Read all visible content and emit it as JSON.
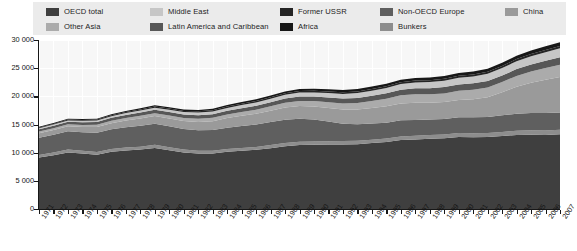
{
  "legend": {
    "rows": [
      [
        {
          "label": "OECD total",
          "color": "#3f3f3f",
          "x": 13
        },
        {
          "label": "Middle East",
          "color": "#c6c6c6",
          "x": 117
        },
        {
          "label": "Former USSR",
          "color": "#252525",
          "x": 247
        },
        {
          "label": "Non-OECD Europe",
          "color": "#5f5f5f",
          "x": 347
        },
        {
          "label": "China",
          "color": "#9a9a9a",
          "x": 472
        }
      ],
      [
        {
          "label": "Other Asia",
          "color": "#ababab",
          "x": 13
        },
        {
          "label": "Latin America and Caribbean",
          "color": "#575757",
          "x": 117
        },
        {
          "label": "Africa",
          "color": "#171717",
          "x": 247
        },
        {
          "label": "Bunkers",
          "color": "#8d8d8d",
          "x": 347
        }
      ]
    ]
  },
  "axes": {
    "y_ticks": [
      "0",
      "5 000",
      "10 000",
      "15 000",
      "20 000",
      "25 000",
      "30 000"
    ],
    "x_ticks": [
      "1971",
      "1972",
      "1973",
      "1974",
      "1975",
      "1976",
      "1977",
      "1978",
      "1979",
      "1980",
      "1981",
      "1982",
      "1983",
      "1984",
      "1985",
      "1986",
      "1987",
      "1988",
      "1989",
      "1990",
      "1991",
      "1992",
      "1993",
      "1994",
      "1995",
      "1996",
      "1997",
      "1998",
      "1999",
      "2000",
      "2001",
      "2002",
      "2003",
      "2004",
      "2005",
      "2006",
      "2007"
    ]
  },
  "colors": {
    "plot_background": "#f7f7f7",
    "gridline": "#ffffff",
    "axis": "#171717",
    "legend_background": "#ebebeb",
    "page_background": "#ffffff"
  },
  "chart_data": {
    "type": "area",
    "stacked": true,
    "title": "",
    "subtitle": "",
    "xlabel": "",
    "ylabel": "",
    "ylim": [
      0,
      30000
    ],
    "ytick_step": 5000,
    "grid": true,
    "legend_position": "top",
    "x": [
      1971,
      1972,
      1973,
      1974,
      1975,
      1976,
      1977,
      1978,
      1979,
      1980,
      1981,
      1982,
      1983,
      1984,
      1985,
      1986,
      1987,
      1988,
      1989,
      1990,
      1991,
      1992,
      1993,
      1994,
      1995,
      1996,
      1997,
      1998,
      1999,
      2000,
      2001,
      2002,
      2003,
      2004,
      2005,
      2006,
      2007
    ],
    "series": [
      {
        "name": "OECD total",
        "color": "#3f3f3f",
        "values": [
          9150,
          9550,
          10050,
          9850,
          9650,
          10150,
          10400,
          10550,
          10850,
          10450,
          10050,
          9850,
          9850,
          10150,
          10350,
          10500,
          10800,
          11150,
          11350,
          11400,
          11450,
          11450,
          11500,
          11700,
          11900,
          12250,
          12350,
          12450,
          12550,
          12800,
          12750,
          12800,
          12950,
          13150,
          13200,
          13150,
          13250
        ]
      },
      {
        "name": "Bunkers",
        "color": "#8d8d8d",
        "values": [
          450,
          470,
          490,
          470,
          470,
          490,
          500,
          520,
          540,
          520,
          500,
          490,
          480,
          490,
          500,
          520,
          540,
          560,
          580,
          590,
          590,
          600,
          600,
          610,
          620,
          640,
          660,
          670,
          680,
          700,
          690,
          700,
          720,
          750,
          770,
          780,
          800
        ]
      },
      {
        "name": "Non-OECD Europe",
        "color": "#5f5f5f",
        "values": [
          3050,
          3150,
          3250,
          3300,
          3400,
          3500,
          3600,
          3700,
          3750,
          3700,
          3650,
          3650,
          3700,
          3800,
          3900,
          4000,
          4100,
          4150,
          4100,
          3900,
          3500,
          3100,
          2950,
          2850,
          2800,
          2850,
          2800,
          2750,
          2750,
          2800,
          2850,
          2850,
          2950,
          3000,
          3050,
          3100,
          3100
        ]
      },
      {
        "name": "China",
        "color": "#9a9a9a",
        "values": [
          800,
          850,
          900,
          950,
          1050,
          1100,
          1200,
          1300,
          1350,
          1400,
          1400,
          1450,
          1550,
          1700,
          1800,
          1900,
          2000,
          2150,
          2250,
          2300,
          2400,
          2500,
          2600,
          2750,
          2900,
          3000,
          3050,
          3000,
          3000,
          3050,
          3200,
          3500,
          4100,
          4800,
          5400,
          5900,
          6300
        ]
      },
      {
        "name": "Other Asia",
        "color": "#ababab",
        "values": [
          300,
          320,
          350,
          360,
          380,
          410,
          440,
          470,
          500,
          520,
          540,
          570,
          600,
          640,
          680,
          720,
          780,
          840,
          900,
          960,
          1030,
          1100,
          1180,
          1260,
          1350,
          1440,
          1500,
          1480,
          1540,
          1620,
          1680,
          1740,
          1820,
          1920,
          2000,
          2080,
          2160
        ]
      },
      {
        "name": "Latin America and Caribbean",
        "color": "#575757",
        "values": [
          420,
          440,
          470,
          490,
          500,
          530,
          560,
          590,
          620,
          640,
          640,
          650,
          640,
          650,
          670,
          700,
          720,
          750,
          780,
          800,
          830,
          860,
          890,
          930,
          970,
          1010,
          1060,
          1100,
          1120,
          1150,
          1140,
          1150,
          1160,
          1210,
          1250,
          1290,
          1330
        ]
      },
      {
        "name": "Middle East",
        "color": "#c6c6c6",
        "values": [
          180,
          200,
          220,
          240,
          260,
          290,
          320,
          350,
          380,
          400,
          420,
          450,
          480,
          520,
          550,
          580,
          620,
          660,
          700,
          740,
          770,
          810,
          860,
          900,
          950,
          1000,
          1050,
          1100,
          1140,
          1180,
          1230,
          1270,
          1330,
          1400,
          1460,
          1520,
          1580
        ]
      },
      {
        "name": "Former USSR",
        "color": "#252525",
        "values": [
          120,
          130,
          140,
          150,
          160,
          170,
          180,
          190,
          200,
          210,
          215,
          220,
          225,
          230,
          240,
          250,
          260,
          270,
          280,
          290,
          295,
          300,
          300,
          305,
          310,
          315,
          320,
          325,
          330,
          340,
          350,
          360,
          375,
          390,
          405,
          420,
          435
        ]
      },
      {
        "name": "Africa",
        "color": "#171717",
        "values": [
          130,
          140,
          150,
          160,
          170,
          180,
          195,
          210,
          225,
          235,
          245,
          255,
          265,
          280,
          295,
          310,
          325,
          340,
          355,
          370,
          380,
          395,
          405,
          420,
          435,
          450,
          470,
          485,
          495,
          510,
          525,
          540,
          560,
          585,
          610,
          635,
          660
        ]
      }
    ]
  }
}
